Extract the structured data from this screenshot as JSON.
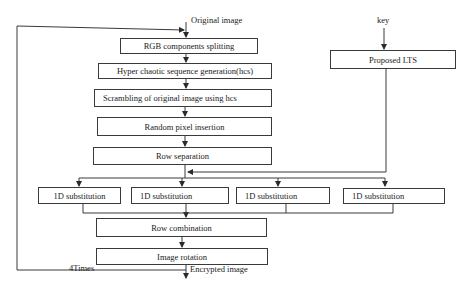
{
  "diagram": {
    "inputs": {
      "original_image": "Original image",
      "key": "key"
    },
    "main_flow": [
      {
        "id": "rgb",
        "label": "RGB components splitting"
      },
      {
        "id": "hcs",
        "label": "Hyper chaotic sequence generation(hcs)"
      },
      {
        "id": "scramble",
        "label": "Scrambling of original image using hcs"
      },
      {
        "id": "random",
        "label": "Random pixel insertion"
      },
      {
        "id": "rowsep",
        "label": "Row separation"
      }
    ],
    "key_flow": {
      "lts": "Proposed LTS"
    },
    "substitutions": [
      {
        "label": "1D substitution"
      },
      {
        "label": "1D substitution"
      },
      {
        "label": "1D substitution"
      },
      {
        "label": "1D substitution"
      }
    ],
    "post_flow": [
      {
        "id": "rowcomb",
        "label": "Row combination"
      },
      {
        "id": "rotate",
        "label": "Image rotation"
      }
    ],
    "loop_label": "4Times",
    "output": "Encrypted image",
    "colors": {
      "line": "#3a3a3a",
      "background": "#ffffff"
    }
  }
}
